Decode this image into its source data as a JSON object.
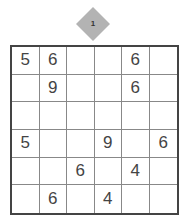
{
  "puzzle": {
    "badge_number": "1",
    "size": 6,
    "colors": {
      "grid_border": "#444444",
      "cell_line": "#888888",
      "badge": "#b3b3b3",
      "digit": "#444444"
    },
    "rows": [
      [
        "5",
        "6",
        "",
        "",
        "6",
        ""
      ],
      [
        "",
        "9",
        "",
        "",
        "6",
        ""
      ],
      [
        "",
        "",
        "",
        "",
        "",
        ""
      ],
      [
        "5",
        "",
        "",
        "9",
        "",
        "6"
      ],
      [
        "",
        "",
        "6",
        "",
        "4",
        ""
      ],
      [
        "",
        "6",
        "",
        "4",
        "",
        ""
      ]
    ]
  }
}
